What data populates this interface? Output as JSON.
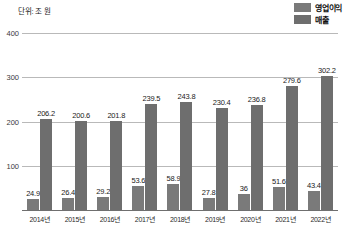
{
  "unit_label": "단위: 조 원",
  "legend": {
    "items": [
      {
        "label": "영업이익",
        "color": "#7a7a7a",
        "icon": "legend-swatch-icon"
      },
      {
        "label": "매출",
        "color": "#6e6e6e",
        "icon": "legend-swatch-icon"
      }
    ]
  },
  "chart_data": {
    "type": "bar",
    "title": "",
    "subtitle": "",
    "xlabel": "",
    "ylabel": "단위: 조 원",
    "ylim": [
      0,
      400
    ],
    "yticks": [
      100,
      200,
      300,
      400
    ],
    "ytick_labels": [
      "100",
      "200",
      "300",
      "400"
    ],
    "grid": true,
    "legend_position": "top-right",
    "categories": [
      "2014년",
      "2015년",
      "2016년",
      "2017년",
      "2018년",
      "2019년",
      "2020년",
      "2021년",
      "2022년"
    ],
    "series": [
      {
        "name": "영업이익",
        "color": "#7a7a7a",
        "values": [
          24.9,
          26.4,
          29.2,
          53.6,
          58.9,
          27.8,
          36,
          51.6,
          43.4
        ],
        "labels": [
          "24.9",
          "26.4",
          "29.2",
          "53.6",
          "58.9",
          "27.8",
          "36",
          "51.6",
          "43.4"
        ]
      },
      {
        "name": "매출",
        "color": "#6e6e6e",
        "values": [
          206.2,
          200.6,
          201.8,
          239.5,
          243.8,
          230.4,
          236.8,
          279.6,
          302.2
        ],
        "labels": [
          "206.2",
          "200.6",
          "201.8",
          "239.5",
          "243.8",
          "230.4",
          "236.8",
          "279.6",
          "302.2"
        ]
      }
    ]
  }
}
